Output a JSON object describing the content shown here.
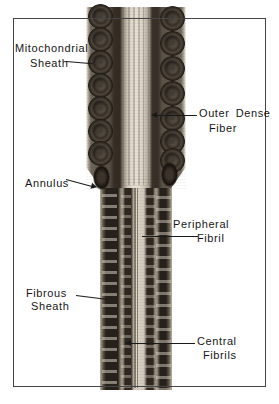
{
  "figure": {
    "palette": {
      "paper": "#ffffff",
      "ink": "#1a1a1a",
      "frame_border": "#454545",
      "photo_dark": "#26211a",
      "photo_mid": "#6e6559",
      "photo_light": "#d8d0c3"
    },
    "labels": {
      "mitochondrial_sheath": {
        "line1": "Mitochondrial",
        "line2": "Sheath"
      },
      "outer_dense_fiber": {
        "line1": "Outer Dense",
        "line2": "Fiber"
      },
      "annulus": {
        "line1": "Annulus"
      },
      "peripheral_fibril": {
        "line1": "Peripheral",
        "line2": "Fibril"
      },
      "fibrous_sheath": {
        "line1": "Fibrous",
        "line2": "Sheath"
      },
      "central_fibrils": {
        "line1": "Central",
        "line2": "Fibrils"
      }
    }
  }
}
